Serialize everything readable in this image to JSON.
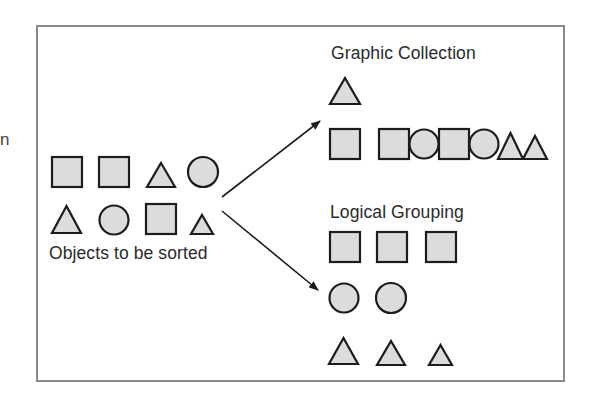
{
  "edge_fragment": "n",
  "source": {
    "label": "Objects to be sorted",
    "objects": [
      {
        "shape": "square",
        "x": 52,
        "y": 157,
        "size": 30
      },
      {
        "shape": "square",
        "x": 99,
        "y": 157,
        "size": 30
      },
      {
        "shape": "triangle",
        "x": 147,
        "y": 163,
        "w": 28,
        "h": 24
      },
      {
        "shape": "circle",
        "cx": 203,
        "cy": 172,
        "r": 15
      },
      {
        "shape": "triangle",
        "x": 52,
        "y": 206,
        "w": 29,
        "h": 27
      },
      {
        "shape": "circle",
        "cx": 114,
        "cy": 220,
        "r": 14.5
      },
      {
        "shape": "square",
        "x": 146,
        "y": 204,
        "size": 30
      },
      {
        "shape": "triangle",
        "x": 191,
        "y": 215,
        "w": 22,
        "h": 19
      }
    ]
  },
  "arrows": [
    {
      "name": "arrow-to-graphic-collection",
      "x1": 222,
      "y1": 197,
      "x2": 320,
      "y2": 121
    },
    {
      "name": "arrow-to-logical-grouping",
      "x1": 222,
      "y1": 211,
      "x2": 318,
      "y2": 290
    }
  ],
  "graphic_collection": {
    "title": "Graphic Collection",
    "objects": [
      {
        "shape": "triangle",
        "x": 330,
        "y": 78,
        "w": 30,
        "h": 26
      },
      {
        "shape": "square",
        "x": 330,
        "y": 129,
        "size": 30
      },
      {
        "shape": "square",
        "x": 379,
        "y": 129,
        "size": 30
      },
      {
        "shape": "circle",
        "cx": 424,
        "cy": 144,
        "r": 14.5
      },
      {
        "shape": "square",
        "x": 439,
        "y": 129,
        "size": 30
      },
      {
        "shape": "circle",
        "cx": 484,
        "cy": 144,
        "r": 14.5
      },
      {
        "shape": "triangle",
        "x": 498,
        "y": 133,
        "w": 25,
        "h": 26
      },
      {
        "shape": "triangle",
        "x": 523,
        "y": 136,
        "w": 24,
        "h": 23
      }
    ]
  },
  "logical_grouping": {
    "title": "Logical Grouping",
    "rows": [
      {
        "group": "squares",
        "objects": [
          {
            "shape": "square",
            "x": 330,
            "y": 232,
            "size": 30
          },
          {
            "shape": "square",
            "x": 377,
            "y": 232,
            "size": 30
          },
          {
            "shape": "square",
            "x": 426,
            "y": 232,
            "size": 30
          }
        ]
      },
      {
        "group": "circles",
        "objects": [
          {
            "shape": "circle",
            "cx": 344,
            "cy": 298,
            "r": 14.5
          },
          {
            "shape": "circle",
            "cx": 391,
            "cy": 298,
            "r": 15
          }
        ]
      },
      {
        "group": "triangles",
        "objects": [
          {
            "shape": "triangle",
            "x": 329,
            "y": 338,
            "w": 29,
            "h": 26
          },
          {
            "shape": "triangle",
            "x": 377,
            "y": 341,
            "w": 28,
            "h": 24
          },
          {
            "shape": "triangle",
            "x": 429,
            "y": 345,
            "w": 23,
            "h": 20
          }
        ]
      }
    ]
  },
  "colors": {
    "fill": "#dcdcdc",
    "stroke": "#1c1c1c",
    "frame": "#8a8a8a",
    "text": "#2a2a2a"
  }
}
